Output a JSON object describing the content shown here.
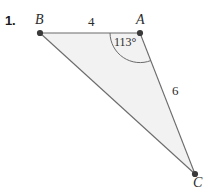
{
  "figure": {
    "problem_number": "1.",
    "background_color": "#ffffff",
    "fill_color": "#f2f2f2",
    "stroke_color": "#6b6b6b",
    "vertex_color": "#3a3a3a",
    "text_color": "#2b2b2b",
    "vertices": [
      {
        "name": "B",
        "label": "B",
        "x": 40,
        "y": 33
      },
      {
        "name": "A",
        "label": "A",
        "x": 140,
        "y": 33
      },
      {
        "name": "C",
        "label": "C",
        "x": 195,
        "y": 174
      }
    ],
    "side_labels": [
      {
        "name": "BA",
        "label": "4"
      },
      {
        "name": "AC",
        "label": "6"
      }
    ],
    "angle_label": "113°"
  }
}
